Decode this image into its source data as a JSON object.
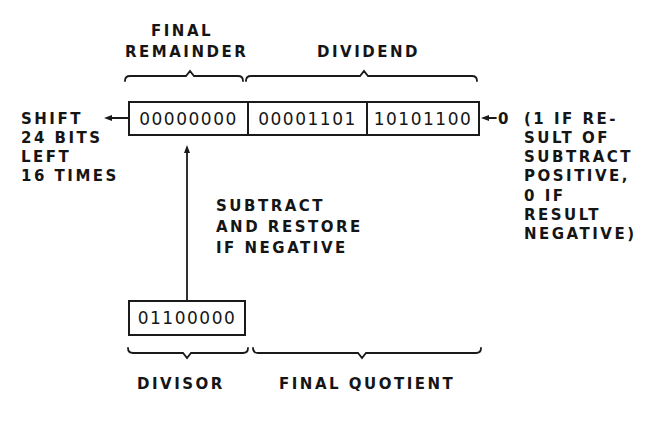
{
  "top_labels": {
    "final_remainder_line1": "FINAL",
    "final_remainder_line2": "REMAINDER",
    "dividend": "DIVIDEND"
  },
  "register": {
    "cells": [
      "00000000",
      "00001101",
      "10101100"
    ]
  },
  "left_note": {
    "lines": [
      "SHIFT",
      "24 BITS",
      "LEFT",
      "16 TIMES"
    ]
  },
  "right_input": {
    "bit": "0",
    "note_lines": [
      "(1 IF RE-",
      "SULT OF",
      "SUBTRACT",
      "POSITIVE,",
      "0 IF",
      "RESULT",
      "NEGATIVE)"
    ]
  },
  "middle_note": {
    "lines": [
      "SUBTRACT",
      "AND RESTORE",
      "IF NEGATIVE"
    ]
  },
  "divisor": {
    "value": "01100000"
  },
  "bottom_labels": {
    "divisor": "DIVISOR",
    "final_quotient": "FINAL QUOTIENT"
  }
}
